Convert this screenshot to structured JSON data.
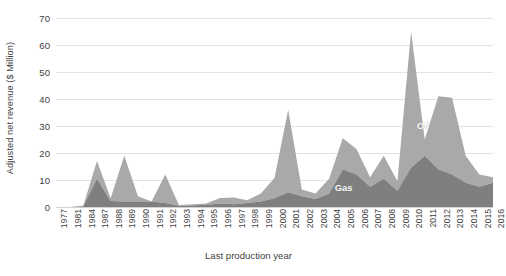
{
  "chart_data": {
    "type": "area",
    "stacked": true,
    "title": "",
    "xlabel": "Last production year",
    "ylabel": "Adjusted net revenue ($ Million)",
    "ylim": [
      0,
      70
    ],
    "ytick_step": 10,
    "yticks": [
      0,
      10,
      20,
      30,
      40,
      50,
      60,
      70
    ],
    "grid": true,
    "legend_position": "inline-annotations",
    "annotations": [
      {
        "text": "Oil",
        "x": 2011,
        "y": 30
      },
      {
        "text": "Gas",
        "x": 2005,
        "y": 7
      }
    ],
    "categories": [
      "1977",
      "1981",
      "1984",
      "1987",
      "1988",
      "1989",
      "1990",
      "1991",
      "1992",
      "1993",
      "1994",
      "1995",
      "1996",
      "1997",
      "1998",
      "1999",
      "2000",
      "2001",
      "2002",
      "2003",
      "2004",
      "2005",
      "2006",
      "2007",
      "2008",
      "2009",
      "2010",
      "2011",
      "2012",
      "2013",
      "2014",
      "2015",
      "2016"
    ],
    "series": [
      {
        "name": "Gas",
        "color": "#7f7f7f",
        "values": [
          0,
          0,
          0.3,
          10.5,
          2.2,
          2.0,
          2.0,
          2.0,
          1.5,
          0.5,
          0.6,
          0.8,
          1.3,
          1.0,
          1.5,
          2.0,
          3.2,
          5.5,
          4.0,
          3.0,
          5.0,
          14.0,
          12.0,
          7.5,
          10.5,
          6.0,
          14.5,
          19.0,
          14.0,
          12.0,
          9.0,
          7.5,
          9.0
        ]
      },
      {
        "name": "Oil",
        "color": "#a9a9a9",
        "values": [
          0,
          0,
          0.2,
          6.5,
          1.0,
          17.0,
          2.0,
          0.0,
          10.5,
          0.2,
          0.4,
          0.5,
          2.0,
          2.5,
          1.0,
          3.0,
          7.5,
          30.5,
          2.5,
          2.0,
          5.5,
          11.5,
          9.5,
          3.5,
          8.5,
          3.5,
          50.5,
          6.0,
          27.0,
          28.5,
          10.0,
          4.5,
          2.0
        ]
      }
    ],
    "totals": [
      0,
      0,
      0.5,
      17.0,
      3.2,
      19.0,
      4.0,
      2.0,
      12.0,
      0.7,
      1.0,
      1.3,
      3.3,
      3.5,
      2.5,
      5.0,
      10.7,
      36.0,
      6.5,
      5.0,
      10.5,
      25.5,
      21.5,
      11.0,
      19.0,
      9.5,
      65.0,
      25.0,
      41.0,
      40.5,
      19.0,
      12.0,
      11.0
    ]
  },
  "caption": ""
}
